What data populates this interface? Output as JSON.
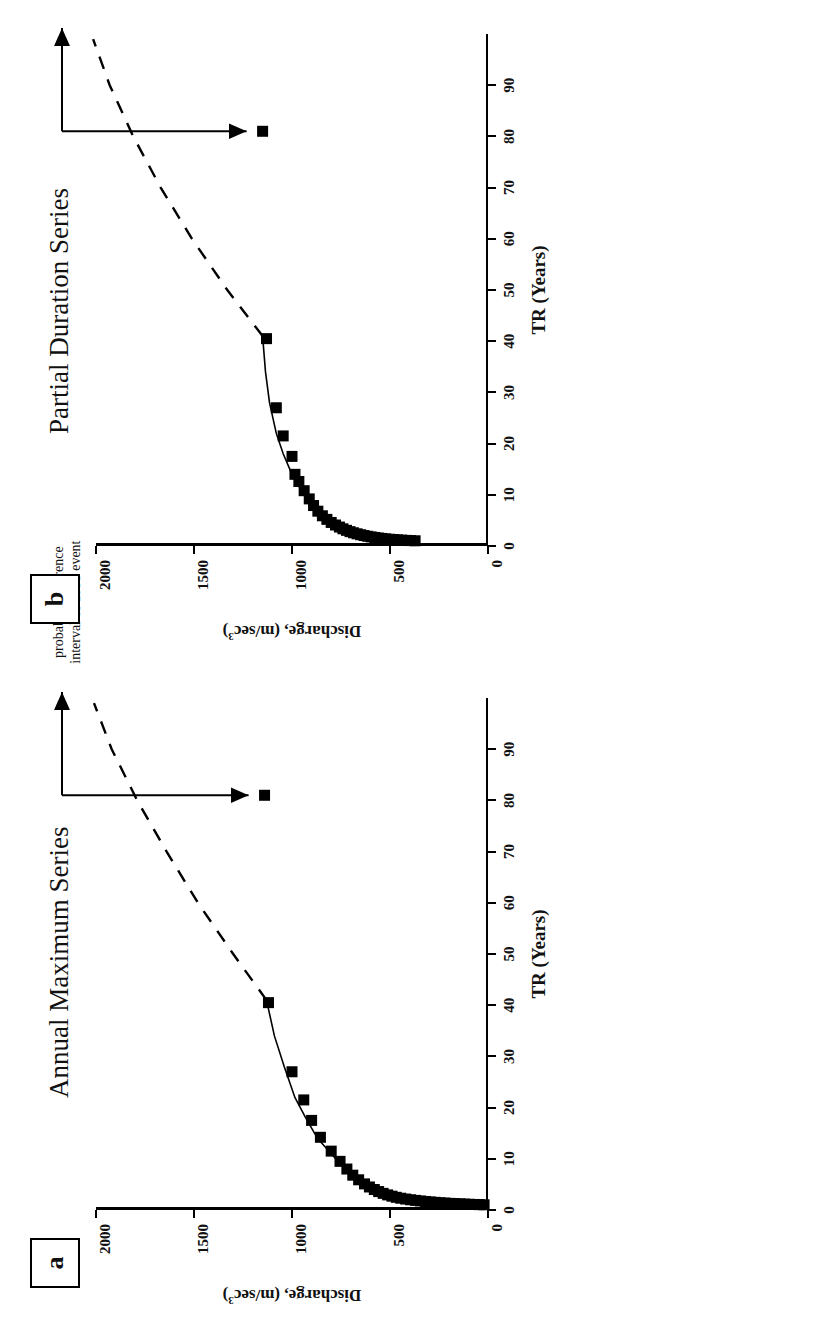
{
  "figure": {
    "orientation_note": "rotated-90",
    "annotation_text": "probable recurrence\ninterval of 1993 event"
  },
  "panels": [
    {
      "tag": "a",
      "title": "Annual Maximum Series",
      "annotation": "probable recurrence\ninterval of 1993 event"
    },
    {
      "tag": "b",
      "title": "Partial Duration Series",
      "annotation": "probable recurrence\ninterval of 1993 event"
    }
  ],
  "axes": {
    "xlabel": "TR (Years)",
    "ylabel_main": "Discharge, (m/sec",
    "ylabel_sup": "3",
    "ylabel_close": ")",
    "xticks": [
      "0",
      "10",
      "20",
      "30",
      "40",
      "50",
      "60",
      "70",
      "80",
      "90"
    ],
    "yticks": [
      "0",
      "500",
      "1000",
      "1500",
      "2000"
    ]
  },
  "chart_data": [
    {
      "type": "scatter",
      "panel": "a",
      "title": "Annual Maximum Series",
      "xlabel": "TR (Years)",
      "ylabel": "Discharge, (m/sec3)",
      "xlim": [
        0,
        100
      ],
      "ylim": [
        0,
        2000
      ],
      "xticks": [
        0,
        10,
        20,
        30,
        40,
        50,
        60,
        70,
        80,
        90
      ],
      "yticks": [
        0,
        500,
        1000,
        1500,
        2000
      ],
      "grid": false,
      "legend": "none",
      "series": [
        {
          "name": "Annual maximum observations",
          "marker": "filled-square",
          "x": [
            1.02,
            1.05,
            1.08,
            1.12,
            1.16,
            1.2,
            1.25,
            1.3,
            1.36,
            1.42,
            1.5,
            1.58,
            1.67,
            1.77,
            1.88,
            2.0,
            2.14,
            2.3,
            2.48,
            2.7,
            2.95,
            3.25,
            3.6,
            4.0,
            4.5,
            5.1,
            5.9,
            6.8,
            8.0,
            9.5,
            11.5,
            14.2,
            17.5,
            21.5,
            27.0,
            40.5,
            81.0
          ],
          "y": [
            20,
            45,
            70,
            95,
            120,
            145,
            170,
            195,
            220,
            245,
            270,
            295,
            320,
            345,
            370,
            395,
            420,
            445,
            468,
            490,
            512,
            535,
            558,
            580,
            605,
            630,
            660,
            690,
            720,
            755,
            800,
            855,
            900,
            940,
            1000,
            1120,
            1140
          ]
        },
        {
          "name": "Fitted frequency curve",
          "style": "solid-line",
          "x": [
            1.0,
            1.5,
            2.0,
            3.0,
            4.0,
            6.0,
            8.0,
            11.0,
            14.0,
            18.0,
            22.0,
            28.0,
            34.0,
            41.0
          ],
          "y": [
            10,
            265,
            400,
            545,
            615,
            680,
            730,
            800,
            870,
            930,
            985,
            1040,
            1090,
            1130
          ]
        },
        {
          "name": "Extrapolated curve",
          "style": "dashed-line",
          "x": [
            41.0,
            50.0,
            60.0,
            70.0,
            80.0,
            90.0,
            99.0
          ],
          "y": [
            1130,
            1300,
            1480,
            1640,
            1790,
            1920,
            2010
          ]
        }
      ],
      "annotations": [
        {
          "text": "probable recurrence interval of 1993 event",
          "x_value": 81,
          "y_value": 1140,
          "arrow_to_x": 99
        }
      ]
    },
    {
      "type": "scatter",
      "panel": "b",
      "title": "Partial Duration Series",
      "xlabel": "TR (Years)",
      "ylabel": "Discharge, (m/sec3)",
      "xlim": [
        0,
        100
      ],
      "ylim": [
        0,
        2000
      ],
      "xticks": [
        0,
        10,
        20,
        30,
        40,
        50,
        60,
        70,
        80,
        90
      ],
      "yticks": [
        0,
        500,
        1000,
        1500,
        2000
      ],
      "grid": false,
      "legend": "none",
      "series": [
        {
          "name": "Partial duration observations",
          "marker": "filled-square",
          "x": [
            1.02,
            1.06,
            1.1,
            1.15,
            1.2,
            1.26,
            1.32,
            1.4,
            1.48,
            1.57,
            1.67,
            1.78,
            1.9,
            2.04,
            2.2,
            2.38,
            2.58,
            2.8,
            3.06,
            3.36,
            3.7,
            4.1,
            4.6,
            5.2,
            5.9,
            6.8,
            7.9,
            9.2,
            10.8,
            12.6,
            14.0,
            17.5,
            21.5,
            27.0,
            40.5,
            81.0
          ],
          "y": [
            372,
            395,
            418,
            440,
            462,
            482,
            502,
            522,
            542,
            560,
            578,
            596,
            614,
            632,
            650,
            668,
            686,
            704,
            722,
            740,
            758,
            778,
            800,
            822,
            845,
            868,
            890,
            912,
            938,
            965,
            985,
            1000,
            1045,
            1080,
            1130,
            1150
          ]
        },
        {
          "name": "Fitted frequency curve",
          "style": "solid-line",
          "x": [
            1.0,
            1.5,
            2.0,
            3.0,
            4.0,
            6.0,
            8.0,
            11.0,
            14.0,
            18.0,
            22.0,
            28.0,
            34.0,
            41.0
          ],
          "y": [
            365,
            545,
            630,
            725,
            790,
            860,
            905,
            955,
            1000,
            1045,
            1080,
            1115,
            1135,
            1150
          ]
        },
        {
          "name": "Extrapolated curve",
          "style": "dashed-line",
          "x": [
            41.0,
            50.0,
            60.0,
            70.0,
            80.0,
            90.0,
            99.0
          ],
          "y": [
            1150,
            1330,
            1510,
            1670,
            1810,
            1930,
            2015
          ]
        }
      ],
      "annotations": [
        {
          "text": "probable recurrence interval of 1993 event",
          "x_value": 81,
          "y_value": 1150,
          "arrow_to_x": 99
        }
      ]
    }
  ]
}
